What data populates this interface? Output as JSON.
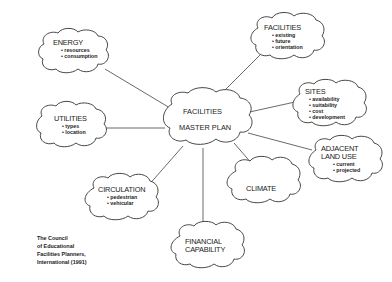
{
  "center": {
    "line1": "FACILITIES",
    "line2": "MASTER PLAN"
  },
  "nodes": {
    "energy": {
      "title": "ENERGY",
      "items": [
        "resources",
        "consumption"
      ]
    },
    "facilities": {
      "title": "FACILITIES",
      "items": [
        "existing",
        "future",
        "orientation"
      ]
    },
    "utilities": {
      "title": "UTILITIES",
      "items": [
        "types",
        "location"
      ]
    },
    "sites": {
      "title": "SITES",
      "items": [
        "availability",
        "suitability",
        "cost",
        "development"
      ]
    },
    "adjacent_land_use": {
      "title_line1": "ADJACENT",
      "title_line2": "LAND USE",
      "items": [
        "current",
        "projected"
      ]
    },
    "climate": {
      "title": "CLIMATE"
    },
    "circulation": {
      "title": "CIRCULATION",
      "items": [
        "pedestrian",
        "vehicular"
      ]
    },
    "financial_capability": {
      "title_line1": "FINANCIAL",
      "title_line2": "CAPABILITY"
    }
  },
  "credit": {
    "line1": "The Council",
    "line2": "of Educational",
    "line3": "Facilities Planners,",
    "line4": "International (1991)"
  }
}
